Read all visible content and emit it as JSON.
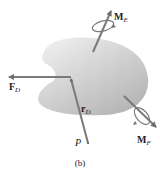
{
  "figure": {
    "caption": "(b)",
    "colors": {
      "body_fill_light": "#f2f2f2",
      "body_fill_dark": "#b8b8b8",
      "vector": "#7a7a7a",
      "text": "#222222"
    }
  },
  "vectors": {
    "force": {
      "symbol": "F",
      "subscript": "D"
    },
    "position": {
      "symbol": "r",
      "subscript": "D"
    },
    "moment_e": {
      "symbol": "M",
      "subscript": "E"
    },
    "moment_f": {
      "symbol": "M",
      "subscript": "F"
    }
  },
  "points": {
    "p": {
      "label": "P"
    }
  }
}
